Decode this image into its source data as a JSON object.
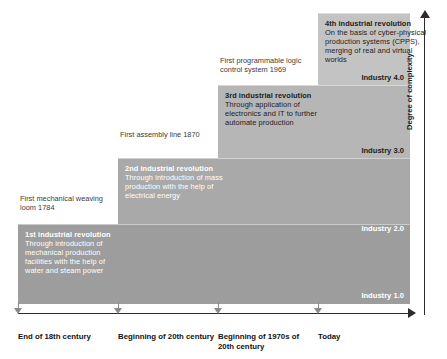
{
  "chart_data": {
    "type": "area",
    "xlabel": "",
    "ylabel": "Degree of complexity",
    "categories": [
      "End of 18th century",
      "Beginning of 20th century",
      "Beginning of 1970s of 20th century",
      "Today"
    ],
    "series": [
      {
        "name": "Degree of complexity",
        "values": [
          1,
          2,
          3,
          4
        ],
        "step_labels": [
          "Industry 1.0",
          "Industry 2.0",
          "Industry 3.0",
          "Industry 4.0"
        ]
      }
    ],
    "grid": false,
    "legend": "none",
    "axis_arrows": true
  },
  "axes": {
    "y_label": "Degree of complexity",
    "x_labels": [
      "End of 18th century",
      "Beginning of 20th century",
      "Beginning of 1970s of 20th century",
      "Today"
    ]
  },
  "steps": [
    {
      "id": "step-1",
      "heading": "1st industrial revolution",
      "body": "Through introduction of mechanical production facilities with the help of water and steam power",
      "industry_label": "Industry 1.0",
      "fill": "#9d9d9d",
      "text_tone": "light"
    },
    {
      "id": "step-2",
      "heading": "2nd industrial revolution",
      "body": "Through introduction of mass production with the help of electrical energy",
      "industry_label": "Industry 2.0",
      "fill": "#a9a9a9",
      "text_tone": "light"
    },
    {
      "id": "step-3",
      "heading": "3rd industrial revolution",
      "body": "Through application of electronics and IT to further automate production",
      "industry_label": "Industry 3.0",
      "fill": "#b6b6b6",
      "text_tone": "dark"
    },
    {
      "id": "step-4",
      "heading": "4th industrial revolution",
      "body": "On the basis of cyber-physical production systems (CPPS), merging of real and virtual worlds",
      "industry_label": "Industry 4.0",
      "fill": "#c3c3c3",
      "text_tone": "dark"
    }
  ],
  "callouts": [
    {
      "id": "callout-1",
      "text": "First mechanical weaving loom 1784"
    },
    {
      "id": "callout-2",
      "text": "First assembly line 1870"
    },
    {
      "id": "callout-3",
      "text": "First programmable logic control system 1969"
    }
  ],
  "colors": {
    "axis": "#2b2b2b",
    "tick_marker": "#8a8a8a",
    "callout_text": "#3b3b3b",
    "label_text": "#111111",
    "light_text": "#ffffff"
  }
}
